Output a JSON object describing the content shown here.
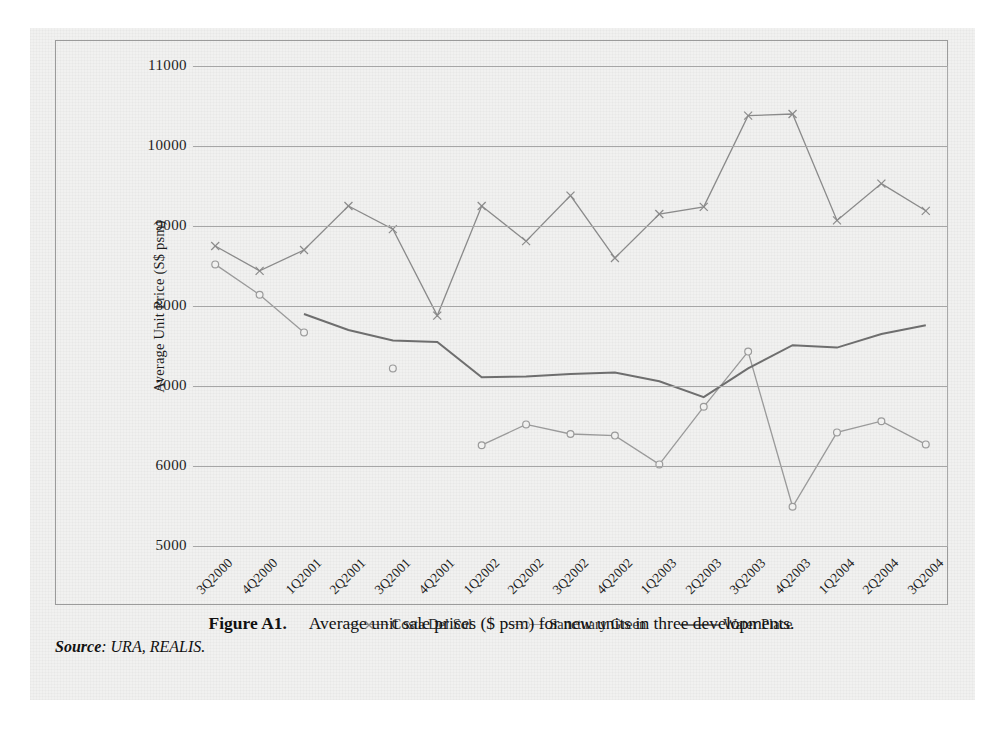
{
  "figure": {
    "caption_number": "Figure A1.",
    "caption_text": "Average unit sale prices ($ psm) for new units in three developments.",
    "source_label": "Source",
    "source_text": ": URA, REALIS."
  },
  "colors": {
    "costa_del_sol": "#8a8a8a",
    "sanctuary_green": "#9a9a9a",
    "water_place": "#6e6e6e",
    "gridline": "#a6a6a6",
    "frame": "#9b9b9b",
    "page": "#f1f1f0",
    "text": "#1d1d1d"
  },
  "chart_data": {
    "type": "line",
    "title": "",
    "xlabel": "",
    "ylabel": "Average Unit Price (S$ psm)",
    "ylim": [
      5000,
      11000
    ],
    "yticks": [
      11000,
      10000,
      9000,
      8000,
      7000,
      6000,
      5000
    ],
    "grid": true,
    "legend_position": "bottom-center",
    "categories": [
      "3Q2000",
      "4Q2000",
      "1Q2001",
      "2Q2001",
      "3Q2001",
      "4Q2001",
      "1Q2002",
      "2Q2002",
      "3Q2002",
      "4Q2002",
      "1Q2003",
      "2Q2003",
      "3Q2003",
      "4Q2003",
      "1Q2004",
      "2Q2004",
      "3Q2004"
    ],
    "series": [
      {
        "name": "Costa Del Sol",
        "marker": "cross",
        "values": [
          8750,
          8440,
          8700,
          9250,
          8960,
          7880,
          9250,
          8810,
          9380,
          8600,
          9150,
          9240,
          10380,
          10400,
          9070,
          9530,
          9190
        ]
      },
      {
        "name": "Sanctuary Green",
        "marker": "open-circle",
        "values": [
          8520,
          8140,
          7670,
          null,
          7220,
          null,
          6260,
          6520,
          6400,
          6380,
          6020,
          6740,
          7430,
          5490,
          6420,
          6560,
          6270
        ]
      },
      {
        "name": "Water Place",
        "marker": "none",
        "values": [
          null,
          null,
          7900,
          7700,
          7570,
          7550,
          7110,
          7120,
          7150,
          7170,
          7060,
          6860,
          7220,
          7510,
          7480,
          7650,
          7760
        ]
      }
    ]
  }
}
